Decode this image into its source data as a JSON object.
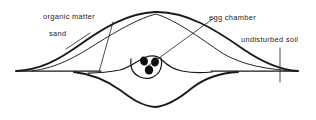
{
  "figure": {
    "type": "cross-section-diagram",
    "background_color": "#ffffff",
    "line_color": "#1a1a1a",
    "egg_color": "#0d0d0d",
    "width": 316,
    "height": 120
  },
  "labels": [
    {
      "id": "organic-matter",
      "text": "organic matter",
      "x": 43,
      "y": 19,
      "leader": "M 113 22 L 99 72"
    },
    {
      "id": "sand",
      "text": "sand",
      "x": 49,
      "y": 36,
      "leader": "M 66 49 L 90 33"
    },
    {
      "id": "egg-chamber",
      "text": "egg chamber",
      "x": 209,
      "y": 20,
      "leader": "M 148 66 L 214 18"
    },
    {
      "id": "undisturbed-soil",
      "text": "undisturbed soil",
      "x": 241,
      "y": 42,
      "leader": "M 280 48 L 280 82"
    }
  ],
  "curves": [
    {
      "id": "ground-line",
      "role": "original ground surface",
      "weight": "medium",
      "path": "M 16 71 L 101 71 M 211 71 L 298 71"
    },
    {
      "id": "mound-outline",
      "role": "outer mound surface",
      "weight": "thick",
      "path": "M 16 71 C 40 70 58 60 78 46 C 103 28 128 13 155 12 C 186 11 216 30 243 49 C 262 62 280 70 298 71"
    },
    {
      "id": "sand-layer",
      "role": "inner sand layer boundary",
      "weight": "thin",
      "path": "M 32 71 C 56 68 76 57 96 44 C 120 29 140 18 156 14 C 176 20 200 38 222 53 C 242 65 268 70 298 71"
    },
    {
      "id": "chamber-upper",
      "role": "chamber roof and shoulders",
      "weight": "medium",
      "path": "M 88 73 C 100 73 110 72 120 70 C 131 67 138 60 146 57 C 152 55 158 56 162 60 C 167 65 172 69 182 71 C 192 73 202 73 212 72"
    },
    {
      "id": "chamber-cavity",
      "role": "egg chamber cavity",
      "weight": "medium",
      "path": "M 131 59 C 130 67 133 74 140 77 C 147 80 155 78 159 72 C 162 67 162 62 161 58"
    },
    {
      "id": "pit-outline",
      "role": "excavated pit below",
      "weight": "thick",
      "path": "M 74 72 C 92 74 106 80 120 90 C 132 99 142 106 155 107 C 168 106 180 98 192 88 C 206 77 220 73 238 72"
    }
  ],
  "eggs": [
    {
      "id": "egg-1",
      "cx": 144,
      "cy": 61,
      "rx": 3.9,
      "ry": 4.6,
      "rotation": -14
    },
    {
      "id": "egg-2",
      "cx": 155,
      "cy": 62,
      "rx": 3.9,
      "ry": 4.6,
      "rotation": 12
    },
    {
      "id": "egg-3",
      "cx": 149,
      "cy": 70,
      "rx": 4.2,
      "ry": 4.6,
      "rotation": 0
    }
  ]
}
